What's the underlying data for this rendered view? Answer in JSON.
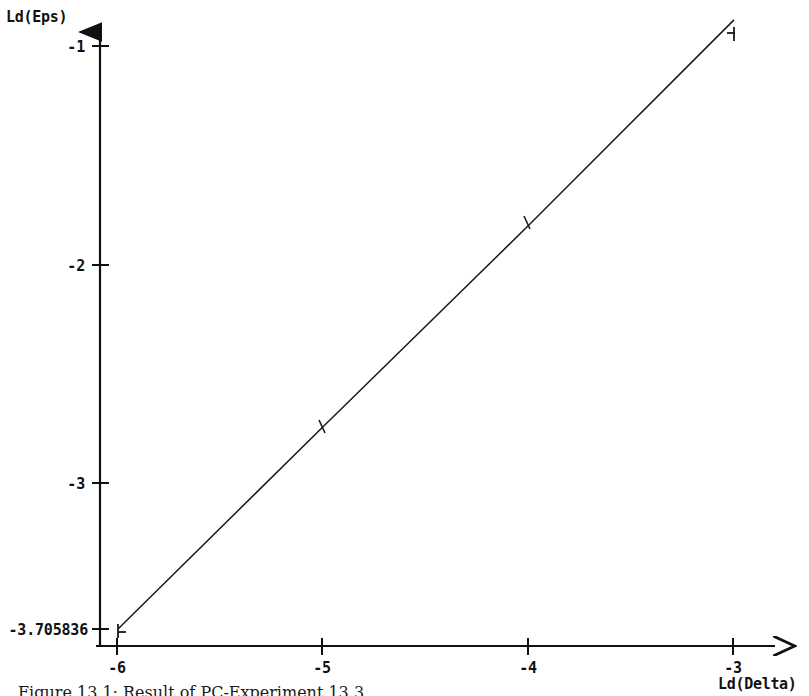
{
  "figure": {
    "caption": "Figure 13.1:  Result of PC-Experiment 13.3",
    "background_color": "#ffffff",
    "ink_color": "#111111"
  },
  "chart_data": {
    "type": "line",
    "title": "",
    "subtitle": "",
    "xlabel": "Ld(Delta)",
    "ylabel": "Ld(Eps)",
    "xlim": [
      -6.0,
      -2.8
    ],
    "ylim": [
      -3.83,
      -0.78
    ],
    "grid": false,
    "legend": null,
    "x": [
      -6,
      -5,
      -4,
      -3
    ],
    "y": [
      -3.705836,
      -2.766,
      -1.832,
      -0.879
    ],
    "series": [
      {
        "name": "Ld(Eps) vs Ld(Delta)",
        "x": [
          -6,
          -5,
          -4,
          -3
        ],
        "values": [
          -3.705836,
          -2.766,
          -1.832,
          -0.879
        ],
        "marker": "tick",
        "line_color": "#1a1a1a",
        "line_width": 1
      }
    ],
    "xticks": [
      {
        "value": -6,
        "label": "-6"
      },
      {
        "value": -5,
        "label": "-5"
      },
      {
        "value": -4,
        "label": "-4"
      },
      {
        "value": -3,
        "label": "-3"
      }
    ],
    "yticks": [
      {
        "value": -1,
        "label": "-1"
      },
      {
        "value": -2,
        "label": "-2"
      },
      {
        "value": -3,
        "label": "-3"
      },
      {
        "value": -3.705836,
        "label": "-3.705836"
      }
    ],
    "annotations": []
  }
}
